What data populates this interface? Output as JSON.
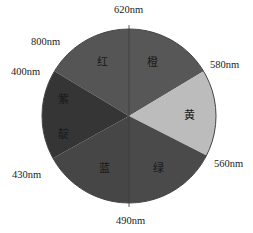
{
  "chart_data": {
    "type": "pie",
    "title": "",
    "center": [
      129,
      116
    ],
    "radius": 87,
    "boundaries": [
      {
        "label": "620nm",
        "angle_deg": 0
      },
      {
        "label": "580nm",
        "angle_deg": 59
      },
      {
        "label": "560nm",
        "angle_deg": 117
      },
      {
        "label": "490nm",
        "angle_deg": 180
      },
      {
        "label": "430nm",
        "angle_deg": 241
      },
      {
        "label": "400nm",
        "angle_deg": 301
      },
      {
        "label": "800nm",
        "angle_deg": 301
      }
    ],
    "wedges": [
      {
        "name": "红",
        "start": 301,
        "end": 360,
        "color": "#555555"
      },
      {
        "name": "橙",
        "start": 0,
        "end": 59,
        "color": "#575757"
      },
      {
        "name": "黄",
        "start": 59,
        "end": 117,
        "color": "#bcbcbc"
      },
      {
        "name": "绿",
        "start": 117,
        "end": 180,
        "color": "#4a4a4a"
      },
      {
        "name": "蓝",
        "start": 180,
        "end": 241,
        "color": "#464646"
      },
      {
        "name": "紫靛",
        "start": 241,
        "end": 301,
        "color": "#353535"
      }
    ]
  },
  "labels": {
    "nm_620": "620nm",
    "nm_580": "580nm",
    "nm_560": "560nm",
    "nm_490": "490nm",
    "nm_430": "430nm",
    "nm_400": "400nm",
    "nm_800": "800nm"
  },
  "wedge_text": {
    "red": "红",
    "orange": "橙",
    "yellow": "黄",
    "green": "绿",
    "blue": "蓝",
    "violet_top": "紫",
    "violet_bottom": "靛"
  }
}
